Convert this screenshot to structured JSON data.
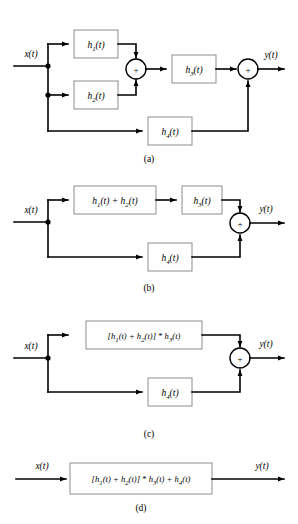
{
  "figure": {
    "colors": {
      "wire": "#000000",
      "block_border": "#8d8d8d",
      "block_fill": "#ffffff",
      "background": "#ffffff"
    },
    "signals": {
      "input": "x(t)",
      "output": "y(t)"
    },
    "operators": {
      "sum": "+",
      "convolution": "*"
    },
    "diagrams": [
      {
        "id": "a",
        "caption": "(a)",
        "input_label": "x(t)",
        "output_label": "y(t)",
        "blocks": [
          {
            "name": "h1",
            "label": "h",
            "sub": "1",
            "arg": "(t)",
            "full": "h_1(t)"
          },
          {
            "name": "h2",
            "label": "h",
            "sub": "2",
            "arg": "(t)",
            "full": "h_2(t)"
          },
          {
            "name": "h3",
            "label": "h",
            "sub": "3",
            "arg": "(t)",
            "full": "h_3(t)"
          },
          {
            "name": "h4",
            "label": "h",
            "sub": "4",
            "arg": "(t)",
            "full": "h_4(t)"
          }
        ],
        "adders": 2
      },
      {
        "id": "b",
        "caption": "(b)",
        "input_label": "x(t)",
        "output_label": "y(t)",
        "blocks": [
          {
            "name": "h1-plus-h2",
            "full": "h_1(t) + h_2(t)"
          },
          {
            "name": "h3",
            "full": "h_3(t)"
          },
          {
            "name": "h4",
            "full": "h_4(t)"
          }
        ],
        "adders": 1
      },
      {
        "id": "c",
        "caption": "(c)",
        "input_label": "x(t)",
        "output_label": "y(t)",
        "blocks": [
          {
            "name": "h1-plus-h2-conv-h3",
            "full": "[h_1(t) + h_2(t)] * h_3(t)"
          },
          {
            "name": "h4",
            "full": "h_4(t)"
          }
        ],
        "adders": 1
      },
      {
        "id": "d",
        "caption": "(d)",
        "input_label": "x(t)",
        "output_label": "y(t)",
        "blocks": [
          {
            "name": "combined",
            "full": "[h_1(t) + h_2(t)] * h_3(t) + h_4(t)"
          }
        ],
        "adders": 0
      }
    ]
  }
}
